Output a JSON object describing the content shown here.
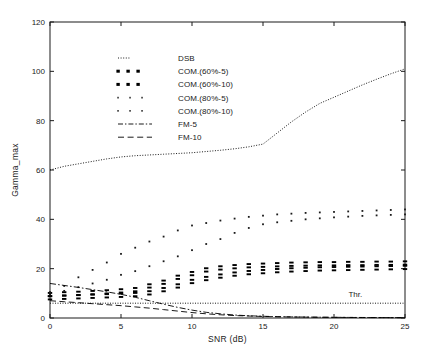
{
  "chart_data": {
    "type": "scatter",
    "title": "",
    "xlabel": "SNR  (dB)",
    "ylabel": "Gamma_max",
    "xlim": [
      0,
      25
    ],
    "ylim": [
      0,
      120
    ],
    "xticks": [
      0,
      5,
      10,
      15,
      20,
      25
    ],
    "yticks": [
      0,
      20,
      40,
      60,
      80,
      100,
      120
    ],
    "xtick_labels": [
      "0",
      "5",
      "10",
      "15",
      "20",
      "25"
    ],
    "ytick_labels": [
      "0",
      "20",
      "40",
      "60",
      "80",
      "100",
      "120"
    ],
    "grid": false,
    "legend_position": "upper-left-inside",
    "annotations": [
      {
        "text": "Thr.",
        "x": 21.5,
        "y": 8.5
      }
    ],
    "threshold": {
      "label": "Thr.",
      "value": 6,
      "style": "dotted"
    },
    "x": [
      0,
      1,
      2,
      3,
      4,
      5,
      6,
      7,
      8,
      9,
      10,
      11,
      12,
      13,
      14,
      15,
      16,
      17,
      18,
      19,
      20,
      21,
      22,
      23,
      24,
      25
    ],
    "series": [
      {
        "name": "DSB",
        "style": "fine-dotted-line",
        "values": [
          60,
          61.5,
          62.5,
          63.5,
          64.5,
          65.3,
          65.8,
          66.1,
          66.4,
          66.7,
          67,
          67.5,
          68,
          68.6,
          69.4,
          70.5,
          75,
          79.5,
          83.5,
          87,
          89.5,
          92,
          94.5,
          96.8,
          99,
          101
        ]
      },
      {
        "name": "COM.(60%-5)",
        "style": "bold-dot-marker",
        "values": [
          9.5,
          9.8,
          10,
          10.3,
          10.6,
          11,
          11.5,
          13,
          14.5,
          16.5,
          18,
          19.5,
          20.3,
          20.8,
          21.2,
          21.4,
          21.6,
          21.8,
          21.9,
          22,
          22,
          22.1,
          22.1,
          22.2,
          22.2,
          22.3
        ]
      },
      {
        "name": "COM.(60%-10)",
        "style": "bold-dot-marker",
        "values": [
          8.2,
          8.4,
          8.6,
          8.8,
          9,
          9.2,
          9.5,
          10.2,
          11.5,
          13,
          14.8,
          16,
          17,
          17.8,
          18.4,
          18.8,
          19.2,
          19.5,
          19.7,
          19.9,
          20,
          20.1,
          20.2,
          20.3,
          20.4,
          20.5
        ]
      },
      {
        "name": "COM.(80%-5)",
        "style": "light-dot-marker",
        "values": [
          10.5,
          13,
          16.5,
          19.5,
          22.5,
          26,
          28.5,
          31,
          33,
          35.5,
          37.5,
          38.5,
          39.5,
          40.3,
          41,
          41.5,
          42,
          42.3,
          42.6,
          42.8,
          43,
          43.2,
          43.4,
          43.6,
          43.8,
          44
        ]
      },
      {
        "name": "COM.(80%-10)",
        "style": "light-dot-marker",
        "values": [
          9.5,
          11,
          12.5,
          14,
          15.5,
          17.5,
          19,
          21,
          23,
          25,
          27.5,
          30,
          32,
          34.5,
          36.5,
          38,
          38.8,
          39.4,
          40,
          40.4,
          40.8,
          41.1,
          41.4,
          41.6,
          41.8,
          42
        ]
      },
      {
        "name": "FM-5",
        "style": "dash-dot-line",
        "values": [
          14,
          13.2,
          12.4,
          11.5,
          10.6,
          9.6,
          8.4,
          7,
          5.6,
          4.3,
          3.2,
          2.3,
          1.7,
          1.2,
          0.9,
          0.7,
          0.55,
          0.45,
          0.38,
          0.32,
          0.28,
          0.24,
          0.21,
          0.18,
          0.16,
          0.14
        ]
      },
      {
        "name": "FM-10",
        "style": "dashed-line",
        "values": [
          7,
          6.6,
          6.2,
          5.8,
          5.4,
          5,
          4.5,
          4,
          3.4,
          2.8,
          2.2,
          1.7,
          1.3,
          1,
          0.8,
          0.62,
          0.5,
          0.42,
          0.35,
          0.3,
          0.26,
          0.22,
          0.19,
          0.17,
          0.15,
          0.13
        ]
      }
    ]
  },
  "axes": {
    "xlabel": "SNR  (dB)",
    "ylabel": "Gamma_max",
    "xtick_labels": [
      "0",
      "5",
      "10",
      "15",
      "20",
      "25"
    ],
    "ytick_labels": [
      "0",
      "20",
      "40",
      "60",
      "80",
      "100",
      "120"
    ]
  },
  "legend": {
    "entries": [
      {
        "label": "DSB",
        "style": "fine-dotted-line"
      },
      {
        "label": "COM.(60%-5)",
        "style": "bold-dot-marker"
      },
      {
        "label": "COM.(60%-10)",
        "style": "bold-dot-marker"
      },
      {
        "label": "COM.(80%-5)",
        "style": "light-dot-marker"
      },
      {
        "label": "COM.(80%-10)",
        "style": "light-dot-marker"
      },
      {
        "label": "FM-5",
        "style": "dash-dot-line"
      },
      {
        "label": "FM-10",
        "style": "dashed-line"
      }
    ]
  },
  "colors": {
    "ink": "#000000",
    "axis": "#1a1a1a",
    "background": "#ffffff"
  }
}
